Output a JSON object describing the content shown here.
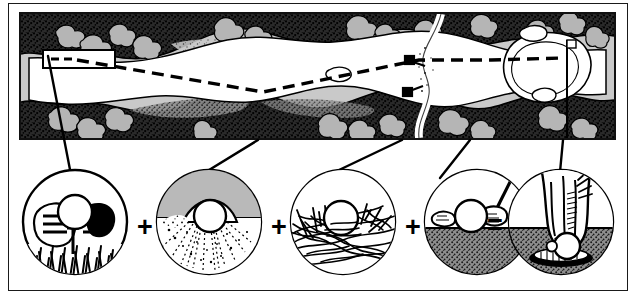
{
  "figure": {
    "background_color": "#ffffff",
    "frame_color": "#1a1a1a",
    "width": 634,
    "height": 296
  },
  "plan_panel": {
    "name": "golf-hole-plan-view",
    "description": "Overhead plan of a golf hole: tee box at left, fairway corridor running right, rough and tree/scrub stipple along both sides, a stream crossing the fairway near the right third, and the putting green with flagstick at far right.",
    "background_color": "#c9c9c9",
    "fairway_color": "#ffffff",
    "rough_color": "#2b2b2b",
    "tree_fill_color": "#b5b5b5",
    "border_color": "#111111",
    "features": [
      {
        "label": "tee-box",
        "type": "callout-rectangle",
        "note": "white rectangle at far left containing a short dashed centre-line marker"
      },
      {
        "label": "fairway",
        "type": "corridor",
        "note": "large white winding corridor from tee to green"
      },
      {
        "label": "rough",
        "type": "stipple-band",
        "note": "dark stippled margins bordering the fairway"
      },
      {
        "label": "trees",
        "type": "canopy-clusters",
        "note": "grey lobed canopy blobs set in black rough"
      },
      {
        "label": "stream",
        "type": "water-hazard",
        "note": "white ribbon crossing the fairway at roughly two-thirds distance"
      },
      {
        "label": "green",
        "type": "putting-green",
        "note": "kidney-shaped green at right with greenside bunkers"
      },
      {
        "label": "flagstick",
        "type": "flag",
        "note": "small flag marker on the green"
      },
      {
        "label": "centre-line",
        "type": "dashed-line",
        "note": "dashed line of play from tee across fairway to the green"
      }
    ]
  },
  "sequence": {
    "name": "shot-sequence",
    "operators": [
      "+",
      "+",
      "+",
      "="
    ],
    "vignettes": [
      {
        "index": 1,
        "name": "tee-shot",
        "caption": "",
        "description": "Golf ball on a tee in grass with an iron clubface addressed behind it",
        "elements": [
          "ball",
          "tee-peg",
          "iron-clubface",
          "grass-tufts"
        ],
        "ground_type": "grass",
        "ground_color": "#111111",
        "sky_color": "#ffffff"
      },
      {
        "index": 2,
        "name": "bunker-shot",
        "caption": "",
        "description": "Ball half buried in a sand bunker with an explosion spray of sand grains",
        "elements": [
          "ball",
          "sand-crater",
          "sand-spray"
        ],
        "ground_type": "sand",
        "ground_color": "#ffffff",
        "sky_color": "#b9b9b9"
      },
      {
        "index": 3,
        "name": "rough-lie",
        "caption": "",
        "description": "Ball sitting down in deep tangled rough grass",
        "elements": [
          "ball",
          "tangled-grass-blades"
        ],
        "ground_type": "deep-rough",
        "ground_color": "#111111",
        "sky_color": "#ffffff"
      },
      {
        "index": 4,
        "name": "putt",
        "caption": "",
        "description": "Ball on the putting surface with a putter head behind it",
        "elements": [
          "ball",
          "putter-head",
          "green-surface"
        ],
        "ground_type": "green",
        "ground_color": "#6e6e6e",
        "sky_color": "#ffffff"
      },
      {
        "index": 5,
        "name": "ball-in-hole",
        "caption": "",
        "description": "A hand reaching into the cup to retrieve the holed ball",
        "elements": [
          "hand",
          "ball",
          "hole-cup",
          "green-surface"
        ],
        "ground_type": "green",
        "ground_color": "#6e6e6e",
        "sky_color": "#ffffff"
      }
    ]
  },
  "leaders": {
    "name": "leader-lines",
    "count": 5,
    "description": "Straight black leader lines linking each plan-view location to its circular vignette below",
    "color": "#000000"
  }
}
